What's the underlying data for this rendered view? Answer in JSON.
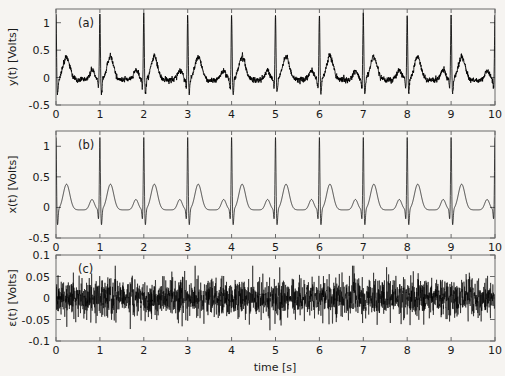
{
  "figure": {
    "background_color": "#f6f4f1",
    "trace_color": "#000000",
    "axis_color": "#6b6b6b",
    "xlabel": "time [s]",
    "xticks": [
      "0",
      "1",
      "2",
      "3",
      "4",
      "5",
      "6",
      "7",
      "8",
      "9",
      "10"
    ],
    "xlim": [
      0,
      10
    ]
  },
  "panels": [
    {
      "tag": "(a)",
      "ylabel": "y(t) [Volts]",
      "yticks": [
        "1",
        "0.5",
        "0",
        "-0.5"
      ],
      "ytick_values": [
        1,
        0.5,
        0,
        -0.5
      ],
      "ylim": [
        -0.5,
        1.25
      ],
      "noisy": true
    },
    {
      "tag": "(b)",
      "ylabel": "x(t) [Volts]",
      "yticks": [
        "1",
        "0.5",
        "0",
        "-0.5"
      ],
      "ytick_values": [
        1,
        0.5,
        0,
        -0.5
      ],
      "ylim": [
        -0.5,
        1.25
      ],
      "noisy": false
    },
    {
      "tag": "(c)",
      "ylabel": "ε(t) [Volts]",
      "yticks": [
        "0.1",
        "0.05",
        "0",
        "-0.05",
        "-0.1"
      ],
      "ytick_values": [
        0.1,
        0.05,
        0,
        -0.05,
        -0.1
      ],
      "ylim": [
        -0.1,
        0.1
      ],
      "noisy": true
    }
  ],
  "chart_data": {
    "type": "line",
    "title": "",
    "xlabel": "time [s]",
    "xlim": [
      0,
      10
    ],
    "grid": false,
    "legend": null,
    "series": [
      {
        "name": "y(t)",
        "panel": "(a)",
        "ylabel": "y(t) [Volts]",
        "ylim": [
          -0.5,
          1.25
        ],
        "yticks": [
          1,
          0.5,
          0,
          -0.5
        ],
        "signal": "ecg_plus_noise",
        "beat_period_s": 1.0,
        "n_beats": 10,
        "noise_amplitude": 0.04,
        "beat_features": {
          "p_wave_center_s": -0.18,
          "p_wave_amp": 0.17,
          "p_wave_width_s": 0.055,
          "q_dip_center_s": -0.03,
          "q_dip_amp": -0.17,
          "q_dip_width_s": 0.012,
          "r_peak_center_s": 0.0,
          "r_peak_amp": 1.2,
          "r_peak_width_s": 0.011,
          "s_dip_center_s": 0.035,
          "s_dip_amp": -0.26,
          "s_dip_width_s": 0.014,
          "t_wave_center_s": 0.24,
          "t_wave_amp": 0.42,
          "t_wave_width_s": 0.075,
          "baseline": -0.04
        }
      },
      {
        "name": "x(t)",
        "panel": "(b)",
        "ylabel": "x(t) [Volts]",
        "ylim": [
          -0.5,
          1.25
        ],
        "yticks": [
          1,
          0.5,
          0,
          -0.5
        ],
        "signal": "ecg_clean",
        "beat_period_s": 1.0,
        "n_beats": 10,
        "noise_amplitude": 0.0,
        "beat_features": {
          "p_wave_center_s": -0.18,
          "p_wave_amp": 0.17,
          "p_wave_width_s": 0.055,
          "q_dip_center_s": -0.03,
          "q_dip_amp": -0.17,
          "q_dip_width_s": 0.012,
          "r_peak_center_s": 0.0,
          "r_peak_amp": 1.2,
          "r_peak_width_s": 0.011,
          "s_dip_center_s": 0.035,
          "s_dip_amp": -0.26,
          "s_dip_width_s": 0.014,
          "t_wave_center_s": 0.24,
          "t_wave_amp": 0.42,
          "t_wave_width_s": 0.075,
          "baseline": -0.04
        }
      },
      {
        "name": "ε(t)",
        "panel": "(c)",
        "ylabel": "ε(t) [Volts]",
        "ylim": [
          -0.1,
          0.1
        ],
        "yticks": [
          0.1,
          0.05,
          0,
          -0.05,
          -0.1
        ],
        "signal": "white_noise",
        "noise_rms": 0.022,
        "noise_peak": 0.075,
        "mean": 0.0
      }
    ]
  }
}
